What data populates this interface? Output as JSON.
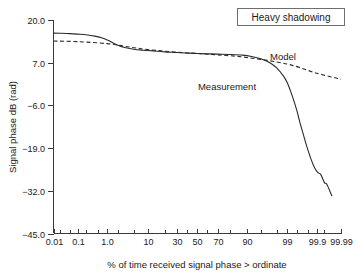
{
  "chart_data": {
    "type": "line",
    "title": "Heavy shadowing",
    "xlabel": "% of time received signal phase > ordinate",
    "ylabel": "Signal phase dB (rad)",
    "x_scale": "normal-probability",
    "grid": false,
    "xlim": [
      0.01,
      99.99
    ],
    "ylim": [
      -45.0,
      20.0
    ],
    "x_tick_labels": [
      "0.01",
      "0.1",
      "1.0",
      "10",
      "30",
      "50",
      "70",
      "90",
      "99",
      "99.9",
      "99.99"
    ],
    "x_tick_values": [
      0.01,
      0.1,
      1.0,
      10,
      30,
      50,
      70,
      90,
      99,
      99.9,
      99.99
    ],
    "x_minor_tick_values": [
      0.02,
      0.05,
      0.2,
      0.5,
      2,
      5,
      20,
      40,
      60,
      80,
      95,
      98,
      99.5,
      99.8,
      99.95
    ],
    "y_tick_labels": [
      "20.0",
      "7.0",
      "-6.0",
      "-19.0",
      "-32.0",
      "-45.0"
    ],
    "y_tick_values": [
      20.0,
      7.0,
      -6.0,
      -19.0,
      -32.0,
      -45.0
    ],
    "legend_position": "inline-annotations",
    "series": [
      {
        "name": "Measurement",
        "style": "solid",
        "color": "#2b2b2b",
        "label_position": {
          "x": 50,
          "y": -1.5
        },
        "points": [
          [
            0.01,
            16.0
          ],
          [
            0.02,
            15.95
          ],
          [
            0.05,
            15.85
          ],
          [
            0.1,
            15.7
          ],
          [
            0.2,
            15.5
          ],
          [
            0.4,
            15.1
          ],
          [
            0.7,
            14.5
          ],
          [
            1.0,
            13.9
          ],
          [
            1.5,
            13.0
          ],
          [
            2.0,
            12.3
          ],
          [
            3.0,
            11.6
          ],
          [
            5.0,
            11.1
          ],
          [
            8.0,
            10.8
          ],
          [
            10.0,
            10.7
          ],
          [
            15.0,
            10.5
          ],
          [
            20.0,
            10.3
          ],
          [
            30.0,
            10.1
          ],
          [
            40.0,
            9.9
          ],
          [
            50.0,
            9.8
          ],
          [
            60.0,
            9.7
          ],
          [
            70.0,
            9.6
          ],
          [
            80.0,
            9.5
          ],
          [
            88.0,
            9.3
          ],
          [
            92.0,
            8.9
          ],
          [
            95.0,
            8.2
          ],
          [
            97.0,
            7.0
          ],
          [
            98.0,
            5.4
          ],
          [
            98.7,
            3.0
          ],
          [
            99.0,
            1.0
          ],
          [
            99.2,
            -1.5
          ],
          [
            99.35,
            -4.0
          ],
          [
            99.5,
            -7.5
          ],
          [
            99.6,
            -11.0
          ],
          [
            99.7,
            -15.0
          ],
          [
            99.78,
            -19.0
          ],
          [
            99.84,
            -22.5
          ],
          [
            99.88,
            -25.0
          ],
          [
            99.91,
            -26.5
          ],
          [
            99.93,
            -27.0
          ],
          [
            99.95,
            -29.5
          ],
          [
            99.96,
            -30.0
          ],
          [
            99.975,
            -33.5
          ]
        ]
      },
      {
        "name": "Model",
        "style": "dashed",
        "color": "#2b2b2b",
        "label_position": {
          "x": 97.5,
          "y": 12.5
        },
        "points": [
          [
            0.01,
            13.6
          ],
          [
            0.1,
            13.4
          ],
          [
            1.0,
            12.8
          ],
          [
            3.0,
            12.0
          ],
          [
            10.0,
            11.0
          ],
          [
            30.0,
            10.2
          ],
          [
            50.0,
            9.8
          ],
          [
            70.0,
            9.4
          ],
          [
            90.0,
            8.6
          ],
          [
            99.0,
            6.6
          ],
          [
            99.9,
            3.8
          ],
          [
            99.99,
            2.0
          ]
        ]
      }
    ]
  },
  "annotations": {
    "measurement_label": "Measurement",
    "model_label": "Model"
  },
  "title_box": {
    "label": "Heavy shadowing"
  }
}
